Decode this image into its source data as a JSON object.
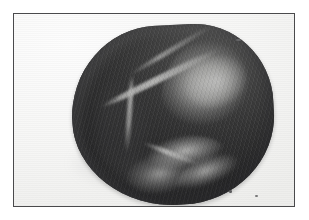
{
  "page": {
    "background_color": "#ffffff",
    "width": 309,
    "height": 220
  },
  "figure": {
    "kind": "photographic-plate",
    "frame": {
      "border_color": "#4a4a4c",
      "border_width_px": 1.5,
      "left": 13,
      "top": 13,
      "width": 282,
      "height": 194
    },
    "plate_background_color": "#f7f7f6",
    "rendering": "halftone-grayscale-print",
    "caption": "",
    "label": "",
    "alt_text": "Grayscale photograph of a rounded anatomical specimen resting on a pale surface, with a soft cast shadow to the lower left."
  },
  "subject": {
    "name": "anatomical-specimen",
    "description": "Rounded, roughly heart-shaped tissue specimen photographed against a plain pale background",
    "dominant_tone": "#6f6f70",
    "highlight_tone": "#fafaf8",
    "shadow_tone": "#4a4a4c",
    "features": [
      {
        "name": "fat-pad-upper-right",
        "tone": "#fafaf8"
      },
      {
        "name": "diagonal-groove-upper-left",
        "tone": "#f2f2f0"
      },
      {
        "name": "vertical-sulcus-centre-left",
        "tone": "#efefed"
      },
      {
        "name": "lower-central-cleft",
        "tone": "#fcfcfa"
      },
      {
        "name": "bright-rim-lower-right",
        "tone": "#f4f4f2"
      },
      {
        "name": "shaded-left-flank",
        "tone": "#505052"
      }
    ]
  },
  "artifacts": {
    "specks": [
      {
        "name": "speck-top"
      },
      {
        "name": "speck-lower-a"
      },
      {
        "name": "speck-lower-b"
      },
      {
        "name": "speck-mid"
      }
    ]
  },
  "shadow": {
    "name": "cast-shadow",
    "tone": "#8d8d8f"
  }
}
